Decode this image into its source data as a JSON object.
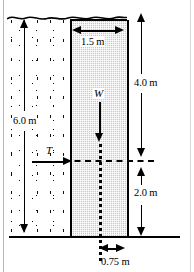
{
  "figure": {
    "type": "engineering-schematic"
  },
  "labels": {
    "width_top": "1.5 m",
    "height_right_upper": "4.0 m",
    "height_right_lower": "2.0 m",
    "height_left": "6.0 m",
    "offset_bottom": "0.75 m",
    "weight_force": "W",
    "thrust_force": "T"
  },
  "dimensions": {
    "wall_width_m": 1.5,
    "soil_height_m": 6.0,
    "upper_segment_m": 4.0,
    "lower_segment_m": 2.0,
    "toe_offset_m": 0.75
  },
  "colors": {
    "block_fill": "#c8c8c8",
    "line": "#000000",
    "background": "#ffffff"
  },
  "regions": {
    "soil_name": "stippled-soil-mass",
    "block_name": "concrete-retaining-wall"
  }
}
